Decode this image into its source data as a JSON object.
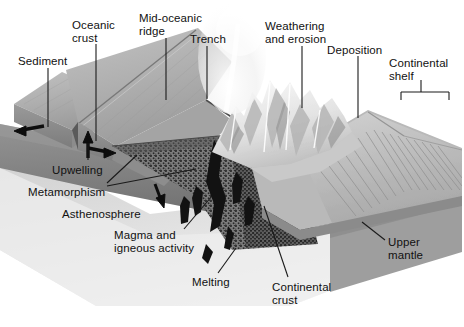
{
  "figure": {
    "type": "geology-cross-section-block-diagram",
    "width": 464,
    "height": 327,
    "background_color": "#ffffff",
    "text_color": "#111111",
    "leader_line_color": "#1a1a1a"
  },
  "palette": {
    "ocean_floor_light": "#b6b6b6",
    "ocean_floor_mid": "#a2a2a2",
    "ocean_crust_face": "#969696",
    "ocean_crust_face_dark": "#7f7f7f",
    "upper_mantle_band": "#8a8a8a",
    "upper_mantle_band_dark": "#6f6f6f",
    "asthenosphere": "#c9c9c9",
    "asthenosphere_light": "#dedede",
    "stipple_slab": "#3c3c3c",
    "magma_black": "#121212",
    "mountains_white": "#f2f2f2",
    "mountain_shadow": "#b9b9b9",
    "shelf_gray": "#c4c4c4",
    "shelf_terrace": "#9d9d9d",
    "plume_white": "#f7f7f7",
    "arrow_black": "#0d0d0d"
  },
  "labels": [
    {
      "id": "sediment",
      "text": "Sediment",
      "x": 18,
      "y": 55,
      "align": "left"
    },
    {
      "id": "oceanic-crust",
      "text": "Oceanic\ncrust",
      "x": 72,
      "y": 19,
      "align": "left"
    },
    {
      "id": "mid-oceanic-ridge",
      "text": "Mid-oceanic\nridge",
      "x": 139,
      "y": 12,
      "align": "left"
    },
    {
      "id": "trench",
      "text": "Trench",
      "x": 190,
      "y": 33,
      "align": "left"
    },
    {
      "id": "weathering-erosion",
      "text": "Weathering\nand erosion",
      "x": 265,
      "y": 20,
      "align": "left"
    },
    {
      "id": "deposition",
      "text": "Deposition",
      "x": 327,
      "y": 44,
      "align": "left"
    },
    {
      "id": "continental-shelf",
      "text": "Continental\nshelf",
      "x": 389,
      "y": 57,
      "align": "left"
    },
    {
      "id": "upwelling",
      "text": "Upwelling",
      "x": 52,
      "y": 164,
      "align": "left"
    },
    {
      "id": "metamorphism",
      "text": "Metamorphism",
      "x": 28,
      "y": 186,
      "align": "left"
    },
    {
      "id": "asthenosphere",
      "text": "Asthenosphere",
      "x": 62,
      "y": 208,
      "align": "left"
    },
    {
      "id": "magma-igneous",
      "text": "Magma and\nigneous activity",
      "x": 114,
      "y": 229,
      "align": "left"
    },
    {
      "id": "melting",
      "text": "Melting",
      "x": 192,
      "y": 276,
      "align": "left"
    },
    {
      "id": "continental-crust",
      "text": "Continental\ncrust",
      "x": 272,
      "y": 281,
      "align": "left"
    },
    {
      "id": "upper-mantle",
      "text": "Upper\nmantle",
      "x": 388,
      "y": 236,
      "align": "left"
    }
  ],
  "leader_lines": [
    {
      "id": "leader-sediment",
      "label": "sediment",
      "points": "48,68 48,127"
    },
    {
      "id": "leader-oceanic-crust",
      "label": "oceanic-crust",
      "points": "96,44 96,141"
    },
    {
      "id": "leader-mid-oceanic-ridge",
      "label": "mid-oceanic-ridge",
      "points": "166,38 166,100"
    },
    {
      "id": "leader-trench",
      "label": "trench",
      "points": "207,46 207,99"
    },
    {
      "id": "leader-weathering",
      "label": "weathering-erosion",
      "points": "302,46 302,108"
    },
    {
      "id": "leader-deposition",
      "label": "deposition",
      "points": "358,56 358,118"
    },
    {
      "id": "leader-upwelling",
      "label": "upwelling",
      "points": "88,160 88,142"
    },
    {
      "id": "leader-metamorphism-upper",
      "label": "metamorphism",
      "points": "107,183 137,155"
    },
    {
      "id": "leader-metamorphism-lower",
      "label": "metamorphism",
      "points": "107,186 196,169"
    },
    {
      "id": "leader-magma",
      "label": "magma-igneous",
      "points": "184,229 212,196"
    },
    {
      "id": "leader-melting",
      "label": "melting",
      "points": "218,273 236,248"
    },
    {
      "id": "leader-continental-crust",
      "label": "continental-crust",
      "points": "288,277 264,206"
    },
    {
      "id": "leader-upper-mantle",
      "label": "upper-mantle",
      "points": "385,240 362,222"
    }
  ],
  "shelf_bracket": {
    "id": "continental-shelf-bracket",
    "left_x": 401,
    "right_x": 449,
    "bar_y": 92,
    "tick_depth": 8,
    "stem_x": 421,
    "stem_top_y": 80
  },
  "arrows": [
    {
      "id": "arrow-spreading-left",
      "description": "plate motion left",
      "x": 28,
      "y": 128,
      "angle": 186,
      "length": 26
    },
    {
      "id": "arrow-spreading-right",
      "description": "plate motion right",
      "x": 102,
      "y": 150,
      "angle": 8,
      "length": 24
    },
    {
      "id": "arrow-upwelling",
      "description": "mantle upwelling",
      "x": 88,
      "y": 148,
      "angle": -84,
      "length": 22
    },
    {
      "id": "arrow-asthenosphere",
      "description": "asthenosphere flow",
      "x": 160,
      "y": 196,
      "angle": 70,
      "length": 22
    }
  ],
  "features": [
    {
      "id": "mid-ocean-ridge",
      "name": "Mid-oceanic ridge"
    },
    {
      "id": "trench-feature",
      "name": "Trench"
    },
    {
      "id": "volcanic-plume",
      "name": "Volcanic plume above trench"
    },
    {
      "id": "mountain-range",
      "name": "Eroding mountain range"
    },
    {
      "id": "continental-shelf-face",
      "name": "Continental shelf terraces"
    },
    {
      "id": "subducting-slab",
      "name": "Stippled subducting slab"
    },
    {
      "id": "magma-bodies",
      "name": "Magma and igneous intrusions"
    },
    {
      "id": "upper-mantle-band",
      "name": "Upper mantle band"
    },
    {
      "id": "asthenosphere-zone",
      "name": "Asthenosphere"
    }
  ]
}
